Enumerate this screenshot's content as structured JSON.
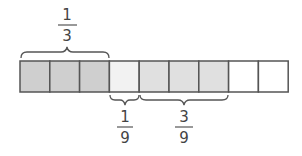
{
  "diagram": {
    "bar": {
      "cells": 9,
      "cell_fills": [
        "#cfcfcf",
        "#cfcfcf",
        "#cfcfcf",
        "#f2f2f2",
        "#e0e0e0",
        "#e0e0e0",
        "#e0e0e0",
        "#ffffff",
        "#ffffff"
      ],
      "stroke": "#555555"
    },
    "labels": {
      "top": {
        "numerator": "1",
        "denominator": "3",
        "spans_cells": [
          1,
          3
        ]
      },
      "bottom_left": {
        "numerator": "1",
        "denominator": "9",
        "spans_cells": [
          4,
          4
        ]
      },
      "bottom_right": {
        "numerator": "3",
        "denominator": "9",
        "spans_cells": [
          5,
          7
        ]
      }
    }
  }
}
